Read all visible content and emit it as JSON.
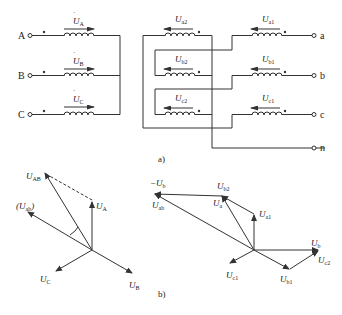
{
  "figure_a": {
    "caption": "a)",
    "primary": {
      "terminals": [
        "A",
        "B",
        "C"
      ],
      "voltages": [
        {
          "base": "U",
          "sub": "A"
        },
        {
          "base": "U",
          "sub": "B"
        },
        {
          "base": "U",
          "sub": "C"
        }
      ]
    },
    "secondary_winding_2": {
      "voltages": [
        {
          "base": "U",
          "sub": "a2"
        },
        {
          "base": "U",
          "sub": "b2"
        },
        {
          "base": "U",
          "sub": "c2"
        }
      ]
    },
    "secondary_winding_1": {
      "voltages": [
        {
          "base": "U",
          "sub": "a1"
        },
        {
          "base": "U",
          "sub": "b1"
        },
        {
          "base": "U",
          "sub": "c1"
        }
      ]
    },
    "output_terminals": [
      "a",
      "b",
      "c",
      "n"
    ]
  },
  "figure_b": {
    "caption": "b)",
    "left_phasor": {
      "labels": {
        "UAB": {
          "base": "U",
          "sub": "AB"
        },
        "Uab_paren": {
          "open": "(",
          "base": "U",
          "sub": "ab",
          "close": ")"
        },
        "UA": {
          "base": "U",
          "sub": "A"
        },
        "UB": {
          "base": "U",
          "sub": "B"
        },
        "UC": {
          "base": "U",
          "sub": "C"
        }
      }
    },
    "right_phasor": {
      "labels": {
        "neg_Ub": {
          "prefix": "−",
          "base": "U",
          "sub": "b"
        },
        "Uab": {
          "base": "U",
          "sub": "ab"
        },
        "Ub2": {
          "base": "U",
          "sub": "b2"
        },
        "Ua": {
          "base": "U",
          "sub": "a"
        },
        "Ua1": {
          "base": "U",
          "sub": "a1"
        },
        "Ub": {
          "base": "U",
          "sub": "b"
        },
        "Uc2": {
          "base": "U",
          "sub": "c2"
        },
        "Uc1": {
          "base": "U",
          "sub": "c1"
        },
        "Ub1": {
          "base": "U",
          "sub": "b1"
        }
      }
    }
  }
}
